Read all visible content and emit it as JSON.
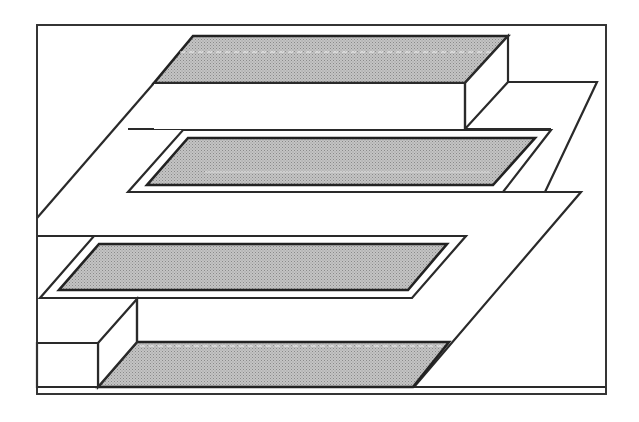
{
  "diagram": {
    "type": "isometric-3d-schematic",
    "colors": {
      "outline": "#2a2a2a",
      "shaded_fill": "#b8b8b8",
      "background": "#ffffff"
    },
    "elements": [
      {
        "id": "frame",
        "label": ""
      },
      {
        "id": "top-block",
        "label": ""
      },
      {
        "id": "upper-trench",
        "label": ""
      },
      {
        "id": "lower-trench",
        "label": ""
      },
      {
        "id": "bottom-block",
        "label": ""
      },
      {
        "id": "serpentine-plane",
        "label": ""
      }
    ]
  }
}
